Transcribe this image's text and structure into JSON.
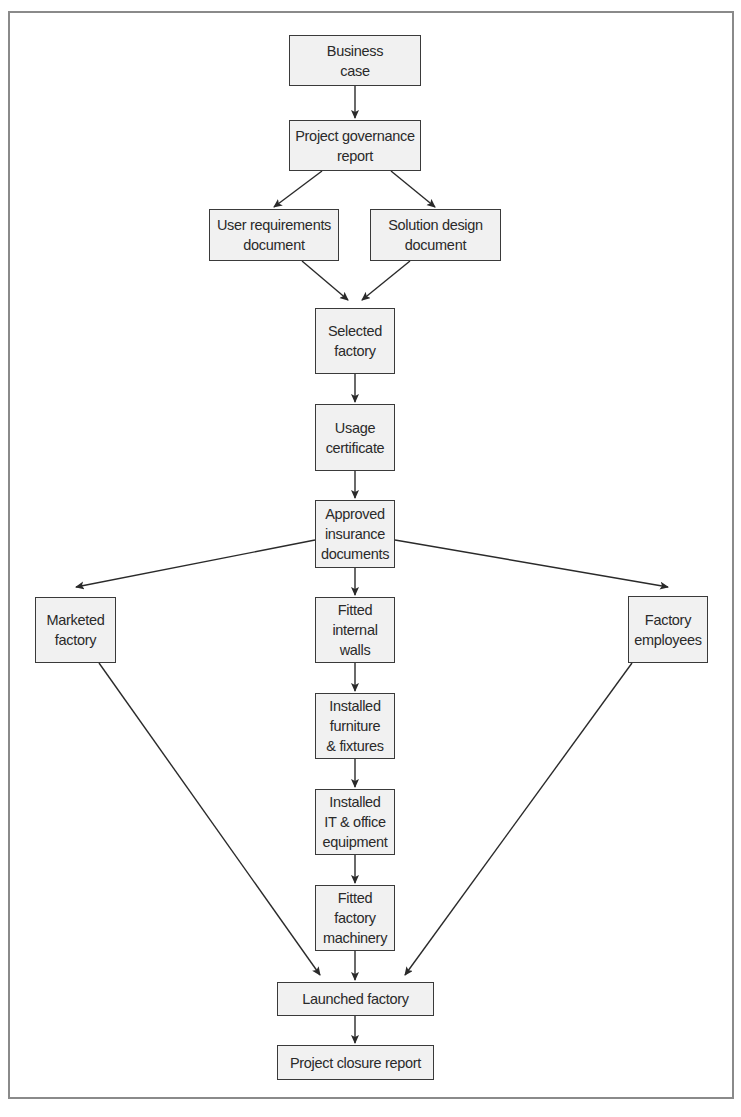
{
  "diagram": {
    "type": "flowchart",
    "colors": {
      "box_fill": "#f1f1f1",
      "box_border": "#3a3a3a",
      "arrow": "#2a2a2a",
      "frame": "#8a8a8a"
    },
    "nodes": [
      {
        "id": "business_case",
        "label": "Business\ncase",
        "x": 289,
        "y": 35,
        "w": 132,
        "h": 51
      },
      {
        "id": "governance",
        "label": "Project governance\nreport",
        "x": 289,
        "y": 120,
        "w": 132,
        "h": 51
      },
      {
        "id": "user_req",
        "label": "User requirements\ndocument",
        "x": 209,
        "y": 209,
        "w": 130,
        "h": 52
      },
      {
        "id": "solution",
        "label": "Solution design\ndocument",
        "x": 370,
        "y": 209,
        "w": 131,
        "h": 52
      },
      {
        "id": "selected",
        "label": "Selected\nfactory",
        "x": 315,
        "y": 308,
        "w": 80,
        "h": 66
      },
      {
        "id": "usage",
        "label": "Usage\ncertificate",
        "x": 315,
        "y": 404,
        "w": 80,
        "h": 67
      },
      {
        "id": "insurance",
        "label": "Approved\ninsurance\ndocuments",
        "x": 315,
        "y": 500,
        "w": 80,
        "h": 68
      },
      {
        "id": "marketed",
        "label": "Marketed\nfactory",
        "x": 35,
        "y": 597,
        "w": 81,
        "h": 66
      },
      {
        "id": "walls",
        "label": "Fitted\ninternal\nwalls",
        "x": 315,
        "y": 597,
        "w": 80,
        "h": 66
      },
      {
        "id": "employees",
        "label": "Factory\nemployees",
        "x": 628,
        "y": 596,
        "w": 80,
        "h": 67
      },
      {
        "id": "furniture",
        "label": "Installed\nfurniture\n& fixtures",
        "x": 315,
        "y": 693,
        "w": 80,
        "h": 66
      },
      {
        "id": "it",
        "label": "Installed\nIT & office\nequipment",
        "x": 315,
        "y": 789,
        "w": 80,
        "h": 66
      },
      {
        "id": "machinery",
        "label": "Fitted\nfactory\nmachinery",
        "x": 315,
        "y": 885,
        "w": 80,
        "h": 66
      },
      {
        "id": "launched",
        "label": "Launched factory",
        "x": 277,
        "y": 982,
        "w": 157,
        "h": 34
      },
      {
        "id": "closure",
        "label": "Project closure report",
        "x": 277,
        "y": 1045,
        "w": 157,
        "h": 35
      }
    ],
    "edges": [
      {
        "from": "business_case",
        "to": "governance",
        "x1": 355,
        "y1": 86,
        "x2": 355,
        "y2": 118
      },
      {
        "from": "governance",
        "to": "user_req",
        "x1": 322,
        "y1": 171,
        "x2": 274,
        "y2": 207
      },
      {
        "from": "governance",
        "to": "solution",
        "x1": 391,
        "y1": 171,
        "x2": 435,
        "y2": 207
      },
      {
        "from": "user_req",
        "to": "selected",
        "x1": 302,
        "y1": 261,
        "x2": 348,
        "y2": 300
      },
      {
        "from": "solution",
        "to": "selected",
        "x1": 410,
        "y1": 261,
        "x2": 362,
        "y2": 300
      },
      {
        "from": "selected",
        "to": "usage",
        "x1": 355,
        "y1": 374,
        "x2": 355,
        "y2": 402
      },
      {
        "from": "usage",
        "to": "insurance",
        "x1": 355,
        "y1": 471,
        "x2": 355,
        "y2": 498
      },
      {
        "from": "insurance",
        "to": "marketed",
        "x1": 315,
        "y1": 540,
        "x2": 76,
        "y2": 587
      },
      {
        "from": "insurance",
        "to": "employees",
        "x1": 395,
        "y1": 540,
        "x2": 668,
        "y2": 587
      },
      {
        "from": "insurance",
        "to": "walls",
        "x1": 355,
        "y1": 568,
        "x2": 355,
        "y2": 595
      },
      {
        "from": "walls",
        "to": "furniture",
        "x1": 355,
        "y1": 663,
        "x2": 355,
        "y2": 691
      },
      {
        "from": "furniture",
        "to": "it",
        "x1": 355,
        "y1": 759,
        "x2": 355,
        "y2": 787
      },
      {
        "from": "it",
        "to": "machinery",
        "x1": 355,
        "y1": 855,
        "x2": 355,
        "y2": 883
      },
      {
        "from": "marketed",
        "to": "launched",
        "x1": 99,
        "y1": 663,
        "x2": 320,
        "y2": 975
      },
      {
        "from": "machinery",
        "to": "launched",
        "x1": 355,
        "y1": 951,
        "x2": 355,
        "y2": 980
      },
      {
        "from": "employees",
        "to": "launched",
        "x1": 632,
        "y1": 663,
        "x2": 405,
        "y2": 975
      },
      {
        "from": "launched",
        "to": "closure",
        "x1": 355,
        "y1": 1016,
        "x2": 355,
        "y2": 1043
      }
    ]
  }
}
